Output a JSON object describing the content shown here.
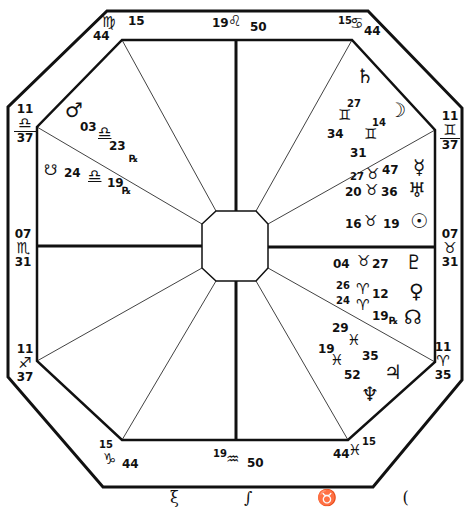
{
  "chart": {
    "type": "octagonal natal horoscope (square-style house chart)",
    "style": "hand-drawn ink on white",
    "colors": {
      "ink": "#111111",
      "background": "#ffffff"
    }
  },
  "house_cusps": {
    "mc": {
      "deg": "19",
      "sign": "♌",
      "min": "50"
    },
    "c11": {
      "deg": "15",
      "sign": "♋",
      "min": "44"
    },
    "c12": {
      "deg": "11",
      "sign": "♊",
      "min": "37"
    },
    "asc": {
      "deg": "07",
      "sign": "♉",
      "min": "31"
    },
    "c2": {
      "deg": "11",
      "sign": "♈",
      "min": "35"
    },
    "c3": {
      "deg": "15",
      "sign": "♓",
      "min": "44"
    },
    "ic": {
      "deg": "19",
      "sign": "♒",
      "min": "50"
    },
    "c5": {
      "deg": "15",
      "sign": "♑",
      "min": "44"
    },
    "c6": {
      "deg": "11",
      "sign": "♐",
      "min": "37"
    },
    "desc": {
      "deg": "07",
      "sign": "♏",
      "min": "31"
    },
    "c8": {
      "deg": "11",
      "sign": "♎",
      "min": "37"
    },
    "c9": {
      "deg": "15",
      "sign": "♍",
      "min": "44"
    }
  },
  "planets": {
    "saturn": {
      "glyph": "♄",
      "deg": "27",
      "sign": "♊",
      "min": "34"
    },
    "moon": {
      "glyph": "☽",
      "deg": "14",
      "sign": "♊",
      "min": "31"
    },
    "mercury": {
      "glyph": "☿",
      "deg": "27",
      "sign": "♉",
      "min": "47"
    },
    "uranus": {
      "glyph": "♅",
      "deg": "20",
      "sign": "♉",
      "min": "36"
    },
    "sun": {
      "glyph": "☉",
      "deg": "16",
      "sign": "♉",
      "min": "19"
    },
    "pluto": {
      "glyph": "♇",
      "deg": "04",
      "sign": "♉",
      "min": "27"
    },
    "venus": {
      "glyph": "♀",
      "deg": "26",
      "sign": "♈",
      "min": "12"
    },
    "north_node": {
      "glyph": "☊",
      "deg": "24",
      "sign": "♈",
      "min": "19",
      "retro": "℞"
    },
    "jupiter": {
      "glyph": "♃",
      "deg": "29",
      "sign": "♓",
      "min": "35"
    },
    "neptune": {
      "glyph": "♆",
      "deg": "19",
      "sign": "♓",
      "min": "52"
    },
    "mars": {
      "glyph": "♂",
      "deg": "03",
      "sign": "♎",
      "min": "23",
      "retro": "℞"
    },
    "south_node": {
      "glyph": "☋",
      "deg": "24",
      "sign": "♎",
      "min": "19",
      "retro": "℞"
    }
  },
  "footer": {
    "text": "ξ ∫ ♉ ("
  }
}
